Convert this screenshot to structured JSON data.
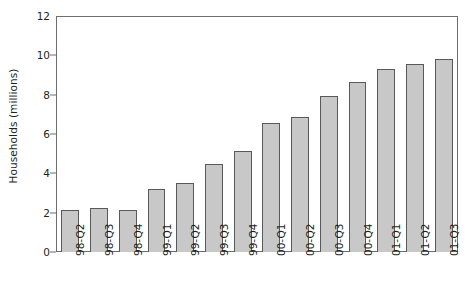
{
  "chart_data": {
    "type": "bar",
    "title": "",
    "subtitle": "",
    "xlabel": "",
    "ylabel": "Households (millions)",
    "ylim": [
      0,
      12
    ],
    "yticks": [
      0,
      2,
      4,
      6,
      8,
      10,
      12
    ],
    "ytick_labels": [
      "0",
      "2",
      "4",
      "6",
      "8",
      "10",
      "12"
    ],
    "grid": false,
    "legend": false,
    "legend_position": "none",
    "bar_fill_color": "#c8c8c8",
    "bar_edge_color": "#58595b",
    "axis_color": "#6d6e71",
    "text_color": "#231f20",
    "background_color": "#ffffff",
    "xtick_rotation": -90,
    "categories": [
      "98-Q2",
      "98-Q3",
      "98-Q4",
      "99-Q1",
      "99-Q2",
      "99-Q3",
      "99-Q4",
      "00-Q1",
      "00-Q2",
      "00-Q3",
      "00-Q4",
      "01-Q1",
      "01-Q2",
      "01-Q3"
    ],
    "values": [
      2.15,
      2.25,
      2.15,
      3.2,
      3.5,
      4.5,
      5.15,
      6.55,
      6.85,
      7.95,
      8.65,
      9.3,
      9.55,
      9.8
    ]
  }
}
